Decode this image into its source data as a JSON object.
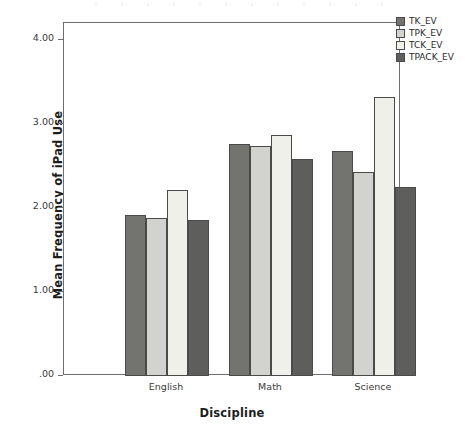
{
  "chart_data": {
    "type": "bar",
    "title": "",
    "subtitle": "",
    "xlabel": "Discipline",
    "ylabel": "Mean Frequency of iPad Use",
    "categories": [
      "English",
      "Math",
      "Science"
    ],
    "series": [
      {
        "name": "TK_EV",
        "color": "#73736f",
        "values": [
          1.92,
          2.76,
          2.68
        ]
      },
      {
        "name": "TPK_EV",
        "color": "#d2d2ce",
        "values": [
          1.88,
          2.74,
          2.43
        ]
      },
      {
        "name": "TCK_EV",
        "color": "#f0f0ea",
        "values": [
          2.22,
          2.87,
          3.32
        ]
      },
      {
        "name": "TPACK_EV",
        "color": "#5e5e5c",
        "values": [
          1.86,
          2.58,
          2.25
        ]
      }
    ],
    "ylim": [
      0,
      4.35
    ],
    "yticks": [
      0.0,
      1.0,
      2.0,
      3.0,
      4.0
    ],
    "ytick_labels": [
      ".00",
      "1.00",
      "2.00",
      "3.00",
      "4.00"
    ],
    "grid": false,
    "legend_position": "top-right",
    "annotations": []
  },
  "axes": {
    "y_title": "Mean Frequency of iPad Use",
    "x_title": "Discipline"
  },
  "legend": {
    "items": [
      {
        "label": "TK_EV"
      },
      {
        "label": "TPK_EV"
      },
      {
        "label": "TCK_EV"
      },
      {
        "label": "TPACK_EV"
      }
    ]
  }
}
